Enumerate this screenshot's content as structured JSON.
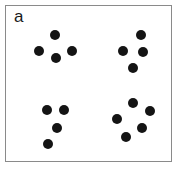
{
  "figure": {
    "width": 180,
    "height": 171,
    "background_color": "#ffffff",
    "panel_label": "a",
    "frame": {
      "x": 5,
      "y": 5,
      "width": 167,
      "height": 157,
      "border_color": "#8a8a8a",
      "border_width": 1,
      "fill_color": "#ffffff"
    }
  },
  "chart_data": {
    "type": "scatter",
    "title": "a",
    "xlabel": "",
    "ylabel": "",
    "xlim": [
      0,
      180
    ],
    "ylim": [
      171,
      0
    ],
    "grid": false,
    "legend": null,
    "marker": {
      "shape": "circle",
      "color": "#141414",
      "diameter": 10
    },
    "point_count": 17,
    "cluster_count": 4,
    "clusters": [
      {
        "name": "top-left",
        "count": 4,
        "points": [
          {
            "x": 55,
            "y": 35
          },
          {
            "x": 39,
            "y": 51
          },
          {
            "x": 72,
            "y": 51
          },
          {
            "x": 56,
            "y": 58
          }
        ]
      },
      {
        "name": "top-right",
        "count": 4,
        "points": [
          {
            "x": 141,
            "y": 35
          },
          {
            "x": 123,
            "y": 51
          },
          {
            "x": 143,
            "y": 52
          },
          {
            "x": 133,
            "y": 68
          }
        ]
      },
      {
        "name": "bottom-left",
        "count": 4,
        "points": [
          {
            "x": 47,
            "y": 110
          },
          {
            "x": 64,
            "y": 110
          },
          {
            "x": 57,
            "y": 128
          },
          {
            "x": 48,
            "y": 144
          }
        ]
      },
      {
        "name": "bottom-right",
        "count": 5,
        "points": [
          {
            "x": 133,
            "y": 103
          },
          {
            "x": 150,
            "y": 111
          },
          {
            "x": 117,
            "y": 119
          },
          {
            "x": 142,
            "y": 128
          },
          {
            "x": 126,
            "y": 137
          }
        ]
      }
    ],
    "points": [
      {
        "x": 55,
        "y": 35
      },
      {
        "x": 39,
        "y": 51
      },
      {
        "x": 72,
        "y": 51
      },
      {
        "x": 56,
        "y": 58
      },
      {
        "x": 141,
        "y": 35
      },
      {
        "x": 123,
        "y": 51
      },
      {
        "x": 143,
        "y": 52
      },
      {
        "x": 133,
        "y": 68
      },
      {
        "x": 47,
        "y": 110
      },
      {
        "x": 64,
        "y": 110
      },
      {
        "x": 57,
        "y": 128
      },
      {
        "x": 48,
        "y": 144
      },
      {
        "x": 133,
        "y": 103
      },
      {
        "x": 150,
        "y": 111
      },
      {
        "x": 117,
        "y": 119
      },
      {
        "x": 142,
        "y": 128
      },
      {
        "x": 126,
        "y": 137
      }
    ]
  }
}
